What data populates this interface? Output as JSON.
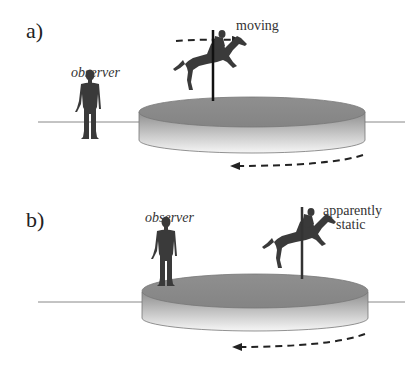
{
  "panels": [
    {
      "id": "a",
      "label": "a)",
      "observer_label": "observer",
      "rider_label": "moving",
      "observer_position": "on ground, off the platform",
      "rider_arrow_direction": "right",
      "platform_arrow_direction": "left"
    },
    {
      "id": "b",
      "label": "b)",
      "observer_label": "observer",
      "rider_label_line1": "apparently",
      "rider_label_line2": "static",
      "observer_position": "on the rotating platform",
      "platform_arrow_direction": "left"
    }
  ],
  "colors": {
    "disk_top": "#8a8a8a",
    "disk_side_dark": "#9a9a9a",
    "disk_side_light": "#f4f4f4",
    "silhouette": "#3a3a3a",
    "line": "#888888",
    "arrow": "#222222"
  }
}
